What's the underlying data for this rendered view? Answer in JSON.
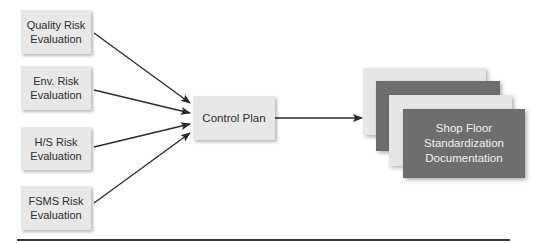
{
  "diagram": {
    "inputs": [
      {
        "line1": "Quality Risk",
        "line2": "Evaluation"
      },
      {
        "line1": "Env. Risk",
        "line2": "Evaluation"
      },
      {
        "line1": "H/S Risk",
        "line2": "Evaluation"
      },
      {
        "line1": "FSMS Risk",
        "line2": "Evaluation"
      }
    ],
    "center": {
      "label": "Control Plan"
    },
    "output": {
      "line1": "Shop Floor",
      "line2": "Standardization",
      "line3": "Documentation"
    },
    "colors": {
      "box_fill": "#e8e8e8",
      "doc_dark": "#6e6e6e",
      "doc_light": "#e6e6e6",
      "arrow": "#2a2a2a"
    }
  }
}
